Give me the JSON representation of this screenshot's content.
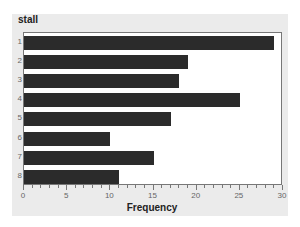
{
  "chart_data": {
    "type": "bar",
    "orientation": "horizontal",
    "title": "stall",
    "xlabel": "Frequency",
    "ylabel": "",
    "categories": [
      "1",
      "2",
      "3",
      "4",
      "5",
      "6",
      "7",
      "8"
    ],
    "values": [
      29,
      19,
      18,
      25,
      17,
      10,
      15,
      11
    ],
    "xlim": [
      0,
      30
    ],
    "xticks": [
      0,
      5,
      10,
      15,
      20,
      25,
      30
    ],
    "grid": false,
    "legend": null,
    "bar_color": "#2b2b2b",
    "background": "#ebebeb"
  }
}
